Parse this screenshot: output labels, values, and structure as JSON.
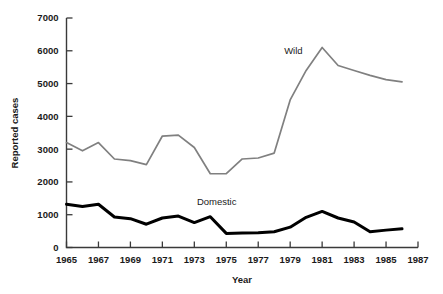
{
  "chart_data": {
    "type": "line",
    "title": "",
    "xlabel": "Year",
    "ylabel": "Reported cases",
    "xlim": [
      1965,
      1987
    ],
    "ylim": [
      0,
      7000
    ],
    "grid": false,
    "legend_position": "inline-annotation",
    "xticks": [
      "1965",
      "1967",
      "1969",
      "1971",
      "1973",
      "1975",
      "1977",
      "1979",
      "1981",
      "1983",
      "1985",
      "1987"
    ],
    "yticks": [
      "0",
      "1000",
      "2000",
      "3000",
      "4000",
      "5000",
      "6000",
      "7000"
    ],
    "x": [
      1965,
      1966,
      1967,
      1968,
      1969,
      1970,
      1971,
      1972,
      1973,
      1974,
      1975,
      1976,
      1977,
      1978,
      1979,
      1980,
      1981,
      1982,
      1983,
      1984,
      1985,
      1986
    ],
    "series": [
      {
        "name": "Wild",
        "color": "#808080",
        "stroke_width": 1.7,
        "label": "Wild",
        "values": [
          3200,
          2950,
          3200,
          2700,
          2650,
          2530,
          3400,
          3430,
          3050,
          2250,
          2250,
          2700,
          2730,
          2880,
          4500,
          5400,
          6100,
          5550,
          5400,
          5250,
          5120,
          5050
        ]
      },
      {
        "name": "Domestic",
        "color": "#000000",
        "stroke_width": 3.0,
        "label": "Domestic",
        "values": [
          1320,
          1250,
          1320,
          930,
          880,
          710,
          900,
          960,
          760,
          940,
          430,
          440,
          450,
          480,
          620,
          920,
          1100,
          900,
          780,
          480,
          530,
          570
        ]
      }
    ],
    "annotations": [
      {
        "text": "Wild",
        "x": 1979.2,
        "y": 5900
      },
      {
        "text": "Domestic",
        "x": 1974.4,
        "y": 1290
      }
    ]
  }
}
